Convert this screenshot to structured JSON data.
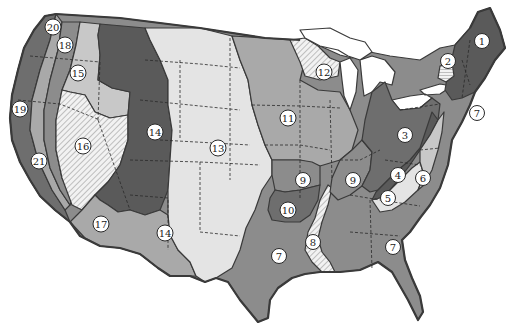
{
  "map": {
    "type": "numbered-region map",
    "subject": "Continental United States divided into numbered regions",
    "colors": {
      "background": "#ffffff",
      "water": "#ffffff",
      "darkest": "#5a5a5a",
      "dark": "#6e6e6e",
      "medium": "#8c8c8c",
      "light": "#a9a9a9",
      "lighter": "#c8c8c8",
      "palest": "#e4e4e4",
      "outline": "#3a3a3a"
    },
    "regions": [
      {
        "id": 1,
        "label": "1",
        "area": "Northern New England",
        "shade": "darkest"
      },
      {
        "id": 2,
        "label": "2",
        "area": "Adirondacks (horizontal hatching)",
        "shade": "hatched"
      },
      {
        "id": 3,
        "label": "3",
        "area": "Appalachian Plateau",
        "shade": "dark"
      },
      {
        "id": 4,
        "label": "4",
        "area": "Blue Ridge / Valley",
        "shade": "darkest"
      },
      {
        "id": 5,
        "label": "5",
        "area": "Southern Piedmont",
        "shade": "palest"
      },
      {
        "id": 6,
        "label": "6",
        "area": "Mid-Atlantic Piedmont",
        "shade": "lighter"
      },
      {
        "id": 7,
        "label": "7",
        "area": "Atlantic & Gulf Coastal Plain",
        "shade": "medium"
      },
      {
        "id": 8,
        "label": "8",
        "area": "Mississippi Delta (diagonal hatching)",
        "shade": "hatched"
      },
      {
        "id": 9,
        "label": "9",
        "area": "Ozark / Interior Highlands",
        "shade": "medium"
      },
      {
        "id": 10,
        "label": "10",
        "area": "Ouachita Region",
        "shade": "dark"
      },
      {
        "id": 11,
        "label": "11",
        "area": "Central Lowlands / Corn Belt",
        "shade": "light"
      },
      {
        "id": 12,
        "label": "12",
        "area": "Upper Great Lakes (diagonal hatching)",
        "shade": "hatched"
      },
      {
        "id": 13,
        "label": "13",
        "area": "Great Plains",
        "shade": "palest"
      },
      {
        "id": 14,
        "label": "14",
        "area": "Rocky Mountains",
        "shade": "darkest"
      },
      {
        "id": 15,
        "label": "15",
        "area": "Columbia Plateau",
        "shade": "lighter"
      },
      {
        "id": 16,
        "label": "16",
        "area": "Great Basin (diagonal hatching)",
        "shade": "hatched"
      },
      {
        "id": 17,
        "label": "17",
        "area": "Southwestern Desert",
        "shade": "light"
      },
      {
        "id": 18,
        "label": "18",
        "area": "Cascade Range",
        "shade": "medium"
      },
      {
        "id": 19,
        "label": "19",
        "area": "Pacific Coast Ranges",
        "shade": "dark"
      },
      {
        "id": 20,
        "label": "20",
        "area": "Puget Trough",
        "shade": "dark"
      },
      {
        "id": 21,
        "label": "21",
        "area": "Central Valley / Sierra Nevada",
        "shade": "medium"
      }
    ],
    "labels": [
      {
        "text": "1",
        "x": 482,
        "y": 41
      },
      {
        "text": "2",
        "x": 448,
        "y": 61
      },
      {
        "text": "3",
        "x": 405,
        "y": 135
      },
      {
        "text": "4",
        "x": 398,
        "y": 175
      },
      {
        "text": "5",
        "x": 388,
        "y": 198
      },
      {
        "text": "6",
        "x": 423,
        "y": 178
      },
      {
        "text": "7",
        "x": 477,
        "y": 113
      },
      {
        "text": "7",
        "x": 279,
        "y": 256
      },
      {
        "text": "7",
        "x": 393,
        "y": 247
      },
      {
        "text": "8",
        "x": 313,
        "y": 242
      },
      {
        "text": "9",
        "x": 303,
        "y": 180
      },
      {
        "text": "9",
        "x": 353,
        "y": 180
      },
      {
        "text": "10",
        "x": 288,
        "y": 210
      },
      {
        "text": "11",
        "x": 288,
        "y": 118
      },
      {
        "text": "12",
        "x": 324,
        "y": 72
      },
      {
        "text": "13",
        "x": 218,
        "y": 148
      },
      {
        "text": "14",
        "x": 155,
        "y": 132
      },
      {
        "text": "14",
        "x": 165,
        "y": 233
      },
      {
        "text": "15",
        "x": 78,
        "y": 73
      },
      {
        "text": "16",
        "x": 83,
        "y": 146
      },
      {
        "text": "17",
        "x": 101,
        "y": 224
      },
      {
        "text": "18",
        "x": 65,
        "y": 45
      },
      {
        "text": "19",
        "x": 20,
        "y": 109
      },
      {
        "text": "20",
        "x": 53,
        "y": 27
      },
      {
        "text": "21",
        "x": 39,
        "y": 161
      }
    ]
  }
}
